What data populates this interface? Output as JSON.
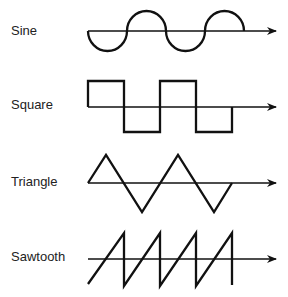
{
  "diagram": {
    "title": "",
    "waveforms": [
      {
        "name": "Sine",
        "label": "Sine"
      },
      {
        "name": "Square",
        "label": "Square"
      },
      {
        "name": "Triangle",
        "label": "Triangle"
      },
      {
        "name": "Sawtooth",
        "label": "Sawtooth"
      }
    ],
    "colors": {
      "stroke": "#111111",
      "text": "#222222",
      "background": "#ffffff"
    }
  }
}
